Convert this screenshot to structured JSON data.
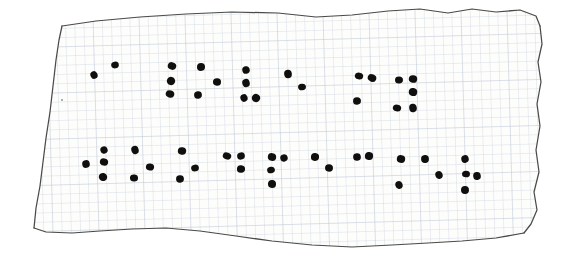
{
  "document": {
    "kind": "hand-drawn-braille-note",
    "title": "Braille dots drawn on torn graph paper",
    "medium": "black ink dots on pale blue grid paper",
    "background_color": "#ffffff",
    "paper_color": "#fdfdfb",
    "grid_color": "#b9c4d6",
    "grid_minor_spacing_px": 9.2,
    "edge_color": "#4a4a48",
    "ink_color": "#100f0d",
    "line_count": 2,
    "dot_count_total": 54
  },
  "paper": {
    "torn_edge_top": "M 62 26 L 96 21 L 140 17 L 186 14 L 232 12 L 278 13 L 316 17 L 352 15 L 388 11 L 420 9 L 448 13 L 472 9 L 496 12 L 520 10 L 536 16 L 540 26",
    "edge_right": "M 540 26 L 542 44 L 538 62 L 541 82 L 537 104 L 540 126 L 536 150 L 539 172 L 534 192 L 537 210 L 531 224 L 524 233",
    "edge_bottom": "M 524 233 L 496 238 L 462 241 L 428 243 L 392 245 L 352 247 L 312 245 L 272 241 L 236 236 L 200 231 L 166 228 L 132 229 L 100 231 L 72 233 L 46 232 L 34 228",
    "edge_left": "M 34 228 L 36 208 L 40 186 L 43 162 L 46 138 L 50 112 L 53 86 L 56 60 L 59 40 L 62 26",
    "note_mark": {
      "x": 62,
      "y": 100,
      "label": "small-pencil-tick"
    }
  },
  "braille": {
    "line1_label": "braille-line-1",
    "line2_label": "braille-line-2",
    "dot_radius_px": 4.0,
    "lines": [
      {
        "id": "line-1",
        "name": "braille-line-1",
        "dots": [
          {
            "x": 94,
            "y": 75
          },
          {
            "x": 115,
            "y": 65
          },
          {
            "x": 172,
            "y": 66
          },
          {
            "x": 171,
            "y": 81
          },
          {
            "x": 170,
            "y": 94
          },
          {
            "x": 201,
            "y": 67
          },
          {
            "x": 217,
            "y": 82
          },
          {
            "x": 198,
            "y": 95
          },
          {
            "x": 246,
            "y": 70
          },
          {
            "x": 246,
            "y": 83
          },
          {
            "x": 244,
            "y": 98
          },
          {
            "x": 256,
            "y": 98
          },
          {
            "x": 288,
            "y": 74
          },
          {
            "x": 302,
            "y": 87
          },
          {
            "x": 359,
            "y": 76
          },
          {
            "x": 372,
            "y": 78
          },
          {
            "x": 357,
            "y": 101
          },
          {
            "x": 399,
            "y": 80
          },
          {
            "x": 413,
            "y": 79
          },
          {
            "x": 413,
            "y": 92
          },
          {
            "x": 397,
            "y": 108
          },
          {
            "x": 413,
            "y": 108
          }
        ]
      },
      {
        "id": "line-2",
        "name": "braille-line-2",
        "dots": [
          {
            "x": 104,
            "y": 150
          },
          {
            "x": 86,
            "y": 164
          },
          {
            "x": 104,
            "y": 162
          },
          {
            "x": 103,
            "y": 177
          },
          {
            "x": 135,
            "y": 150
          },
          {
            "x": 134,
            "y": 178
          },
          {
            "x": 150,
            "y": 167
          },
          {
            "x": 182,
            "y": 151
          },
          {
            "x": 180,
            "y": 179
          },
          {
            "x": 195,
            "y": 168
          },
          {
            "x": 227,
            "y": 156
          },
          {
            "x": 241,
            "y": 156
          },
          {
            "x": 241,
            "y": 169
          },
          {
            "x": 272,
            "y": 157
          },
          {
            "x": 284,
            "y": 158
          },
          {
            "x": 271,
            "y": 170
          },
          {
            "x": 272,
            "y": 184
          },
          {
            "x": 315,
            "y": 157
          },
          {
            "x": 329,
            "y": 168
          },
          {
            "x": 357,
            "y": 157
          },
          {
            "x": 369,
            "y": 156
          },
          {
            "x": 401,
            "y": 159
          },
          {
            "x": 399,
            "y": 185
          },
          {
            "x": 425,
            "y": 159
          },
          {
            "x": 439,
            "y": 175
          },
          {
            "x": 465,
            "y": 159
          },
          {
            "x": 466,
            "y": 174
          },
          {
            "x": 477,
            "y": 176
          },
          {
            "x": 465,
            "y": 190
          }
        ]
      }
    ]
  }
}
